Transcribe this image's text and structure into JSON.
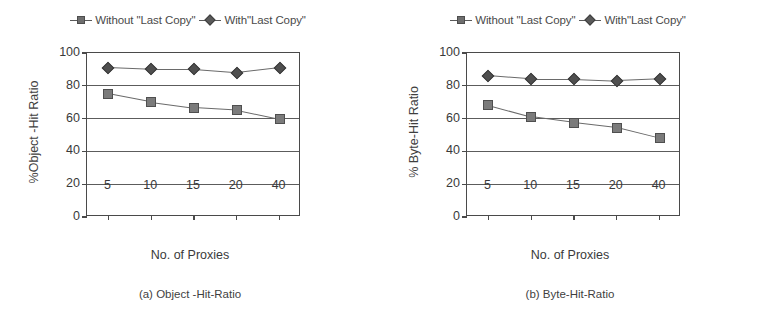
{
  "figure": {
    "panels": [
      {
        "id": "panel-a",
        "caption": "(a) Object -Hit-Ratio",
        "ylabel": "%Object -Hit Ratio",
        "xlabel": "No. of Proxies",
        "legend": [
          {
            "label": "Without \"Last Copy\"",
            "marker": "square-marker-icon",
            "color": "#7b7b7b"
          },
          {
            "label": "With\"Last Copy\"",
            "marker": "diamond-marker-icon",
            "color": "#4f4f4f"
          }
        ],
        "yticks": [
          "0",
          "20",
          "40",
          "60",
          "80",
          "100"
        ],
        "xticks": [
          "5",
          "10",
          "15",
          "20",
          "40"
        ]
      },
      {
        "id": "panel-b",
        "caption": "(b) Byte-Hit-Ratio",
        "ylabel": "% Byte-Hit Ratio",
        "xlabel": "No. of Proxies",
        "legend": [
          {
            "label": "Without \"Last Copy\"",
            "marker": "square-marker-icon",
            "color": "#7b7b7b"
          },
          {
            "label": "With\"Last Copy\"",
            "marker": "diamond-marker-icon",
            "color": "#4f4f4f"
          }
        ],
        "yticks": [
          "0",
          "20",
          "40",
          "60",
          "80",
          "100"
        ],
        "xticks": [
          "5",
          "10",
          "15",
          "20",
          "40"
        ]
      }
    ]
  },
  "chart_data": [
    {
      "type": "line",
      "title": "(a) Object -Hit-Ratio",
      "xlabel": "No. of Proxies",
      "ylabel": "%Object -Hit Ratio",
      "categories": [
        "5",
        "10",
        "15",
        "20",
        "40"
      ],
      "x": [
        5,
        10,
        15,
        20,
        40
      ],
      "ylim": [
        0,
        100
      ],
      "yticks": [
        0,
        20,
        40,
        60,
        80,
        100
      ],
      "grid": "horizontal",
      "legend_position": "above-center",
      "series": [
        {
          "name": "Without \"Last Copy\"",
          "marker": "square",
          "values": [
            75,
            70,
            66.5,
            65,
            59.5
          ]
        },
        {
          "name": "With\"Last Copy\"",
          "marker": "diamond",
          "values": [
            91,
            90,
            90,
            88,
            91
          ]
        }
      ]
    },
    {
      "type": "line",
      "title": "(b) Byte-Hit-Ratio",
      "xlabel": "No. of Proxies",
      "ylabel": "% Byte-Hit Ratio",
      "categories": [
        "5",
        "10",
        "15",
        "20",
        "40"
      ],
      "x": [
        5,
        10,
        15,
        20,
        40
      ],
      "ylim": [
        0,
        100
      ],
      "yticks": [
        0,
        20,
        40,
        60,
        80,
        100
      ],
      "grid": "horizontal",
      "legend_position": "above-center",
      "series": [
        {
          "name": "Without \"Last Copy\"",
          "marker": "square",
          "values": [
            68,
            61,
            57.5,
            54.5,
            48
          ]
        },
        {
          "name": "With\"Last Copy\"",
          "marker": "diamond",
          "values": [
            86,
            84,
            84,
            83,
            84
          ]
        }
      ]
    }
  ]
}
